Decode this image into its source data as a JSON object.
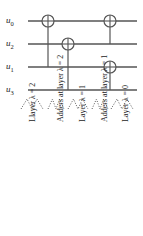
{
  "figure": {
    "kind": "quantum-circuit-diagram",
    "width": 143,
    "height": 236,
    "background": "#ffffff",
    "ink": "#555555",
    "text_color": "#1a1a1a"
  },
  "wires": [
    {
      "id": "w0",
      "label": "u",
      "sub": "0",
      "y": 21
    },
    {
      "id": "w1",
      "label": "u",
      "sub": "2",
      "y": 44
    },
    {
      "id": "w2",
      "label": "u",
      "sub": "1",
      "y": 67
    },
    {
      "id": "w3",
      "label": "u",
      "sub": "3",
      "y": 90
    }
  ],
  "wire_span": {
    "x_start": 28,
    "x_end": 137
  },
  "gates": [
    {
      "name": "cnot-1",
      "symbol": "oplus",
      "x": 48,
      "target_y": 21,
      "control_y": 67,
      "radius": 6
    },
    {
      "name": "cnot-2",
      "symbol": "oplus",
      "x": 68,
      "target_y": 44,
      "control_y": 90,
      "radius": 6
    },
    {
      "name": "cnot-3",
      "symbol": "oplus",
      "x": 110,
      "target_y": 21,
      "control_y": 44,
      "radius": 6
    },
    {
      "name": "cnot-4",
      "symbol": "oplus",
      "x": 110,
      "target_y": 67,
      "control_y": 90,
      "radius": 6
    }
  ],
  "braces": [
    {
      "name": "brace-layer-0",
      "cx": 122,
      "y": 103,
      "width": 22
    },
    {
      "name": "brace-adders-1",
      "cx": 100,
      "y": 103,
      "width": 16
    },
    {
      "name": "brace-layer-1",
      "cx": 78,
      "y": 103,
      "width": 20
    },
    {
      "name": "brace-adders-2",
      "cx": 56,
      "y": 103,
      "width": 16
    },
    {
      "name": "brace-layer-2",
      "cx": 32,
      "y": 103,
      "width": 22
    }
  ],
  "layer_labels": [
    {
      "name": "label-layer-0",
      "text": "Layer λ = 0",
      "x": 122,
      "y": 122
    },
    {
      "name": "label-adders-1",
      "text": "Adders at layer λ = 1",
      "x": 101,
      "y": 122
    },
    {
      "name": "label-layer-1",
      "text": "Layer λ = 1",
      "x": 79,
      "y": 122
    },
    {
      "name": "label-adders-2",
      "text": "Adders at layer λ = 2",
      "x": 57,
      "y": 122
    },
    {
      "name": "label-layer-2",
      "text": "Llayer λ = 2",
      "x": 29,
      "y": 122
    }
  ]
}
